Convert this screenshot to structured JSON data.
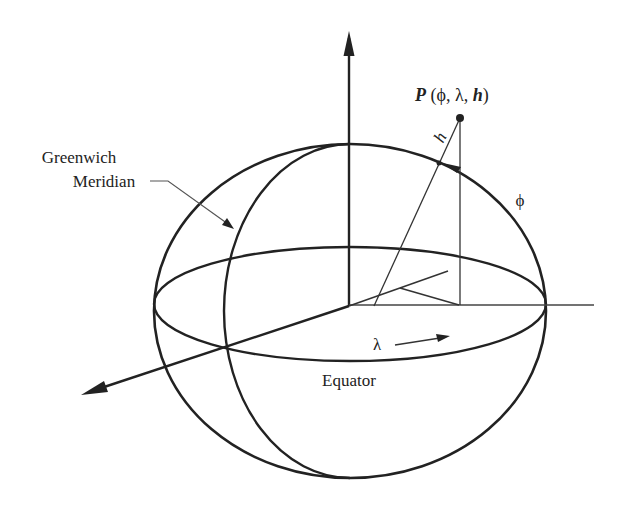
{
  "figure": {
    "type": "geodetic-coordinate-diagram",
    "labels": {
      "greenwich_line1": "Greenwich",
      "greenwich_line2": "Meridian",
      "equator": "Equator",
      "lambda": "λ",
      "phi": "ϕ",
      "h": "h",
      "point_name": "P",
      "point_open": " (ϕ, λ, ",
      "point_h": "h",
      "point_close": ")"
    },
    "colors": {
      "stroke": "#222222",
      "leader": "#555555",
      "background": "#ffffff"
    }
  }
}
